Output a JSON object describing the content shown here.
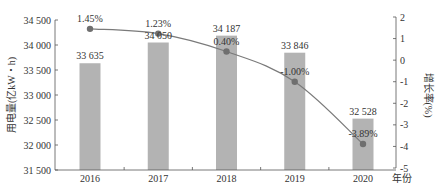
{
  "chart_data": {
    "type": "bar",
    "title": "",
    "categories": [
      "2016",
      "2017",
      "2018",
      "2019",
      "2020"
    ],
    "xlabel": "年份",
    "series": [
      {
        "name": "用电量",
        "type": "bar",
        "axis": "left",
        "values": [
          33635,
          34050,
          34187,
          33846,
          32528
        ],
        "labels": [
          "33 635",
          "34 050",
          "34 187",
          "33 846",
          "32 528"
        ],
        "color": "#b3b3b3"
      },
      {
        "name": "增长率",
        "type": "line",
        "axis": "right",
        "values": [
          1.45,
          1.23,
          0.4,
          -1.0,
          -3.89
        ],
        "labels": [
          "1.45%",
          "1.23%",
          "0.40%",
          "-1.00%",
          "-3.89%"
        ],
        "color": "#7a7a7a"
      }
    ],
    "left_axis": {
      "label": "用电量(亿kW・h)",
      "ylim": [
        31500,
        34500
      ],
      "ticks": [
        31500,
        32000,
        32500,
        33000,
        33500,
        34000,
        34500
      ],
      "tick_labels": [
        "31 500",
        "32 000",
        "32 500",
        "33 000",
        "33 500",
        "34 000",
        "34 500"
      ]
    },
    "right_axis": {
      "label": "增长率(%)",
      "ylim": [
        -5,
        2
      ],
      "ticks": [
        -5,
        -4,
        -3,
        -2,
        -1,
        0,
        1,
        2
      ],
      "tick_labels": [
        "-5",
        "-4",
        "-3",
        "-2",
        "-1",
        "0",
        "1",
        "2"
      ]
    },
    "grid": false,
    "legend": "none"
  }
}
